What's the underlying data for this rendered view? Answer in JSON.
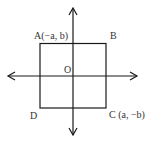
{
  "diagram": {
    "labels": {
      "A": "A(−a, b)",
      "B": "B",
      "C": "C (a, −b)",
      "D": "D",
      "O": "O"
    },
    "colors": {
      "stroke": "#1a1a1a",
      "text": "#333333"
    }
  }
}
